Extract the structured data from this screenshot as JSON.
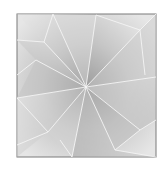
{
  "image": {
    "subject": "pencil drawing of a square with shaded faceted triangles radiating from a central point",
    "colors": {
      "background": "#ffffff",
      "frame": "#7a7a7a",
      "light_facet": "#e4e4e4",
      "mid_facet": "#c9c9c9",
      "dark_facet": "#aaaaaa",
      "fold_line": "#f4f4f4"
    }
  }
}
